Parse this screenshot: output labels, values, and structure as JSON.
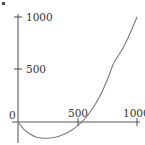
{
  "figure": {
    "background_color": "#ffffff",
    "axis_color": "#5a5a5a",
    "curve_color": "#7a7a7a",
    "text_color": "#333333",
    "corner_mark": "corner-artifact"
  },
  "axes": {
    "x_ticks": [
      {
        "value": 0,
        "label": "0"
      },
      {
        "value": 500,
        "label": "500"
      },
      {
        "value": 1000,
        "label": "1000"
      }
    ],
    "y_ticks": [
      {
        "value": 0,
        "label": "0"
      },
      {
        "value": 500,
        "label": "500"
      },
      {
        "value": 1000,
        "label": "1000"
      }
    ]
  },
  "chart_data": {
    "type": "line",
    "title": "",
    "subtitle": "",
    "xlabel": "",
    "ylabel": "",
    "xlim": [
      0,
      1000
    ],
    "ylim": [
      -200,
      1000
    ],
    "grid": false,
    "legend": null,
    "axis_style": "crossed-spines-at-origin",
    "x_ticks": [
      0,
      500,
      1000
    ],
    "y_ticks": [
      0,
      500,
      1000
    ],
    "x_tick_labels": [
      "0",
      "500",
      "1000"
    ],
    "y_tick_labels": [
      "0",
      "500",
      "1000"
    ],
    "annotations": [],
    "series": [
      {
        "name": "curve",
        "color": "#7a7a7a",
        "x": [
          0,
          50,
          100,
          150,
          200,
          250,
          300,
          350,
          400,
          450,
          500,
          520,
          540,
          560,
          580,
          600,
          640,
          680,
          720,
          760,
          800,
          840,
          880,
          920,
          960,
          1000
        ],
        "y": [
          0,
          -70,
          -115,
          -142,
          -153,
          -155,
          -148,
          -133,
          -110,
          -78,
          -36,
          -16,
          6,
          30,
          57,
          86,
          152,
          230,
          322,
          428,
          550,
          625,
          700,
          790,
          890,
          1000
        ]
      }
    ]
  }
}
